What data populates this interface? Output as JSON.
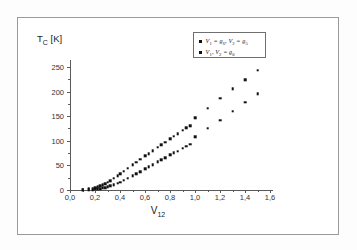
{
  "figure": {
    "background_color": "#ffffff",
    "frame_color": "#9a9a9a",
    "marker_color": "#111111"
  },
  "axes": {
    "y_title": "Tc [K]",
    "y_title_main": "T",
    "y_title_sub": "C",
    "y_title_unit": " [K]",
    "x_title": "V",
    "x_title_sub": "12"
  },
  "legend": {
    "entries": [
      {
        "label": "V1 = g6, V2 = g5",
        "marker": "square"
      },
      {
        "label": "V1, V2 = g0",
        "marker": "square"
      }
    ],
    "entry_parts": [
      {
        "a": "V",
        "a_sub": "1",
        "eq1": " = ",
        "b": "g",
        "b_sub": "6",
        "comma": ", ",
        "c": "V",
        "c_sub": "2",
        "eq2": " = ",
        "d": "g",
        "d_sub": "5"
      },
      {
        "a": "V",
        "a_sub": "1",
        "comma": ", ",
        "c": "V",
        "c_sub": "2",
        "eq2": " = ",
        "d": "g",
        "d_sub": "0"
      }
    ]
  },
  "chart_data": {
    "type": "scatter",
    "title": "",
    "xlabel": "V12",
    "ylabel": "Tc [K]",
    "xlim": [
      0.0,
      1.6
    ],
    "ylim": [
      0,
      260
    ],
    "xticks": [
      0.0,
      0.2,
      0.4,
      0.6,
      0.8,
      1.0,
      1.2,
      1.4,
      1.6
    ],
    "xticklabels": [
      "0,0",
      "0,2",
      "0,4",
      "0,6",
      "0,8",
      "1,0",
      "1,2",
      "1,4",
      "1,6"
    ],
    "yticks": [
      0,
      50,
      100,
      150,
      200,
      250
    ],
    "yticklabels": [
      "0",
      "50",
      "100",
      "150",
      "200",
      "250"
    ],
    "grid": false,
    "legend_position": "upper right",
    "series": [
      {
        "name": "V1 = g6, V2 = g5",
        "marker": "square",
        "color": "#111111",
        "x": [
          0.1,
          0.15,
          0.18,
          0.2,
          0.22,
          0.24,
          0.26,
          0.28,
          0.3,
          0.32,
          0.35,
          0.38,
          0.4,
          0.43,
          0.46,
          0.5,
          0.53,
          0.56,
          0.6,
          0.63,
          0.66,
          0.7,
          0.73,
          0.76,
          0.8,
          0.83,
          0.86,
          0.9,
          0.93,
          0.96,
          1.0,
          1.1,
          1.2,
          1.3,
          1.4,
          1.5
        ],
        "y": [
          1,
          2,
          3,
          4,
          6,
          8,
          10,
          13,
          16,
          19,
          24,
          29,
          33,
          38,
          44,
          51,
          56,
          62,
          69,
          74,
          80,
          87,
          92,
          97,
          104,
          109,
          114,
          121,
          126,
          131,
          147,
          166,
          186,
          205,
          224,
          243
        ]
      },
      {
        "name": "V1, V2 = g0",
        "marker": "square",
        "color": "#111111",
        "x": [
          0.1,
          0.15,
          0.18,
          0.2,
          0.22,
          0.24,
          0.26,
          0.28,
          0.3,
          0.32,
          0.35,
          0.38,
          0.4,
          0.43,
          0.46,
          0.5,
          0.53,
          0.56,
          0.6,
          0.63,
          0.66,
          0.7,
          0.73,
          0.76,
          0.8,
          0.83,
          0.86,
          0.9,
          0.93,
          0.96,
          1.0,
          1.1,
          1.2,
          1.3,
          1.4,
          1.5
        ],
        "y": [
          0,
          1,
          1,
          2,
          2,
          3,
          4,
          5,
          6,
          8,
          11,
          14,
          16,
          20,
          24,
          29,
          33,
          37,
          43,
          47,
          51,
          57,
          61,
          65,
          71,
          75,
          79,
          85,
          89,
          93,
          108,
          125,
          142,
          160,
          178,
          196
        ]
      }
    ]
  }
}
